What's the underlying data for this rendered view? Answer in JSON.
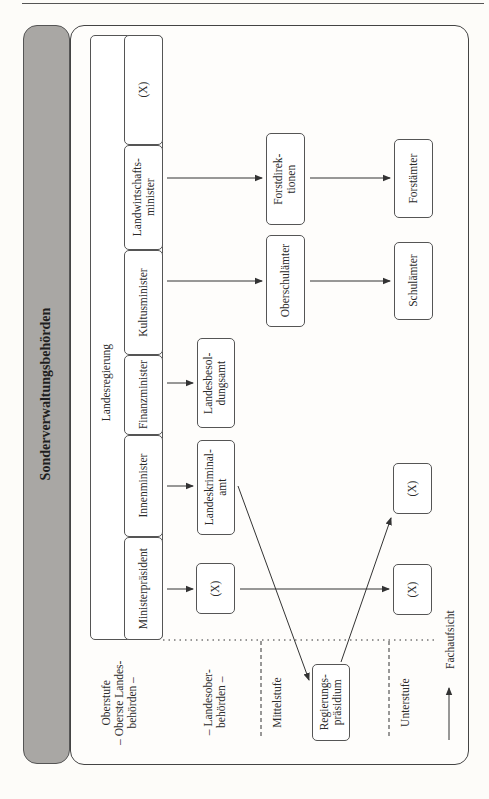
{
  "title": "Sonderverwaltungsbehörden",
  "landesregierung": {
    "label": "Landesregierung",
    "ministries": [
      {
        "id": "x-top",
        "label": "(X)"
      },
      {
        "id": "landwirtschaft",
        "label": "Landwirtschafts-\nminister"
      },
      {
        "id": "kultus",
        "label": "Kultusminister"
      },
      {
        "id": "finanz",
        "label": "Finanzminister"
      },
      {
        "id": "innen",
        "label": "Innenminister"
      },
      {
        "id": "praesident",
        "label": "Ministerpräsident"
      }
    ]
  },
  "landesoberbehoerden": [
    {
      "id": "landesbesoldungsamt",
      "label": "Landesbesol-\ndungsamt"
    },
    {
      "id": "landeskriminalamt",
      "label": "Landeskriminal-\namt"
    },
    {
      "id": "x-lob",
      "label": "(X)"
    }
  ],
  "mittelstufe": [
    {
      "id": "forstdirektionen",
      "label": "Forstdirek-\ntionen"
    },
    {
      "id": "oberschulaemter",
      "label": "Oberschulämter"
    },
    {
      "id": "regierungspraesidium",
      "label": "Regierungs-\npräsidium"
    }
  ],
  "unterstufe": [
    {
      "id": "forstaemter",
      "label": "Forstämter"
    },
    {
      "id": "schulaemter",
      "label": "Schulämter"
    },
    {
      "id": "x-unter-1",
      "label": "(X)"
    },
    {
      "id": "x-unter-2",
      "label": "(X)"
    }
  ],
  "levels": {
    "oberstufe": "Oberstufe\n– Oberste Landes-\nbehörden –",
    "landesober": "– Landesober-\nbehörden –",
    "mittel": "Mittelstufe",
    "unter": "Unterstufe"
  },
  "legend": {
    "label": "Fachaufsicht",
    "icon": "arrow-icon"
  },
  "colors": {
    "header_bg": "#a9a7a4",
    "line": "#333333"
  }
}
